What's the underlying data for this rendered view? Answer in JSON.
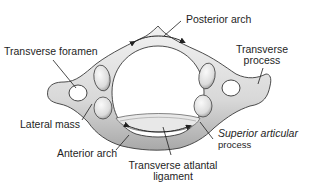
{
  "diagram": {
    "labels": {
      "posterior_arch": "Posterior arch",
      "transverse_foramen": "Transverse foramen",
      "transverse_process_line1": "Transverse",
      "transverse_process_line2": "process",
      "lateral_mass": "Lateral mass",
      "anterior_arch": "Anterior arch",
      "transverse_atlantal_ligament_line1": "Transverse atlantal",
      "transverse_atlantal_ligament_line2": "ligament",
      "superior_articular_line1": "Superior articular",
      "superior_articular_line2": "process"
    },
    "colors": {
      "bone_fill": "#e4e4e4",
      "bone_shadow": "#8c8c8c",
      "outline": "#3a3a3a",
      "background": "#ffffff",
      "text": "#1e1e1e"
    }
  }
}
